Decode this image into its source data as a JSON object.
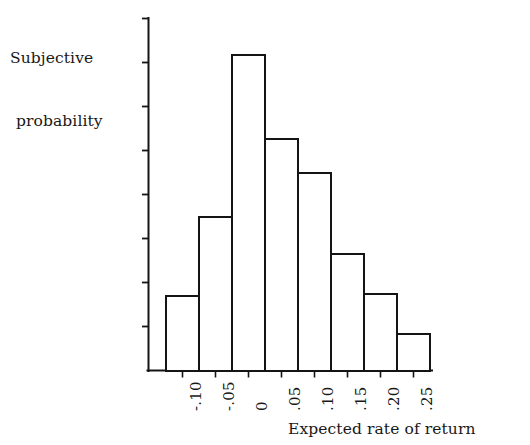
{
  "figure": {
    "y_axis_title_line1": "Subjective",
    "y_axis_title_line2": "probability",
    "x_axis_title": "Expected rate of return"
  },
  "chart_data": {
    "type": "bar",
    "title": "",
    "subtitle": "",
    "xlabel": "Expected rate of return",
    "ylabel": "Subjective probability",
    "categories": [
      "-.10",
      "-.05",
      "0",
      ".05",
      ".10",
      ".15",
      ".20",
      ".25"
    ],
    "bin_edges": [
      -0.125,
      -0.075,
      -0.025,
      0.025,
      0.075,
      0.125,
      0.175,
      0.225,
      0.275
    ],
    "values": [
      1.7,
      3.5,
      7.16,
      5.27,
      4.48,
      2.64,
      1.73,
      0.84
    ],
    "value_unit": "axis tick units",
    "ylim": [
      0,
      8
    ],
    "xlim": [
      -0.135,
      0.285
    ],
    "yticks": [
      1,
      2,
      3,
      4,
      5,
      6,
      7,
      8
    ],
    "yticklabels": [
      "",
      "",
      "",
      "",
      "",
      "",
      "",
      ""
    ],
    "xticklabels": [
      "-.10",
      "-.05",
      "0",
      ".05",
      ".10",
      ".15",
      ".20",
      ".25"
    ],
    "xticklabel_rotation": 90,
    "grid": false,
    "legend": null,
    "bar_fill": "#ffffff",
    "bar_edge": "#141414",
    "axis_color": "#141414",
    "background": "#ffffff"
  }
}
